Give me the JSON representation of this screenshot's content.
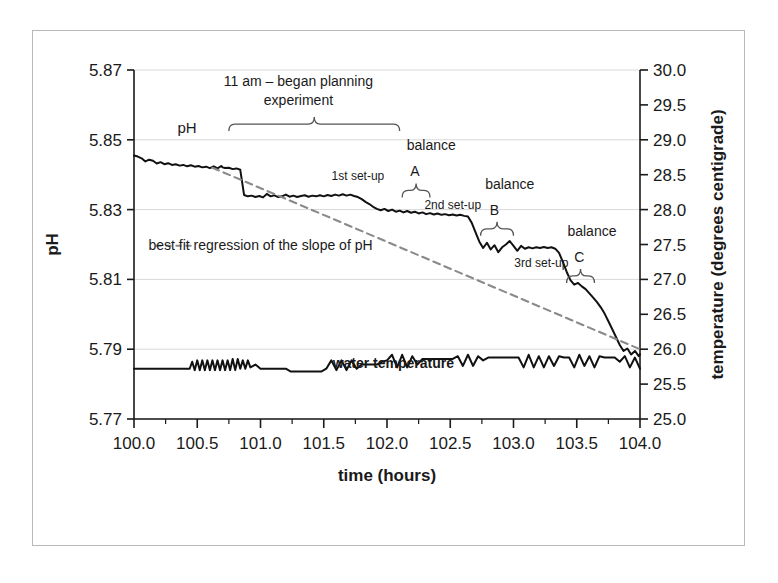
{
  "chart_data": {
    "type": "line",
    "title": "",
    "xlabel": "time (hours)",
    "ylabel": "pH",
    "y2label": "temperature (degrees centigrade)",
    "xlim": [
      100.0,
      104.0
    ],
    "ylim": [
      5.77,
      5.87
    ],
    "y2lim": [
      25.0,
      30.0
    ],
    "grid": true,
    "x_ticks": [
      "100.0",
      "100.5",
      "101.0",
      "101.5",
      "102.0",
      "102.5",
      "103.0",
      "103.5",
      "104.0"
    ],
    "x_tick_values": [
      100.0,
      100.5,
      101.0,
      101.5,
      102.0,
      102.5,
      103.0,
      103.5,
      104.0
    ],
    "x_minor_step": 0.25,
    "y_ticks": [
      "5.77",
      "5.79",
      "5.81",
      "5.83",
      "5.85",
      "5.87"
    ],
    "y_tick_values": [
      5.77,
      5.79,
      5.81,
      5.83,
      5.85,
      5.87
    ],
    "y2_ticks": [
      "25.0",
      "25.5",
      "26.0",
      "26.5",
      "27.0",
      "27.5",
      "28.0",
      "28.5",
      "29.0",
      "29.5",
      "30.0"
    ],
    "y2_tick_values": [
      25.0,
      25.5,
      26.0,
      26.5,
      27.0,
      27.5,
      28.0,
      28.5,
      29.0,
      29.5,
      30.0
    ],
    "legend_position": "inside-left",
    "series": [
      {
        "name": "pH",
        "axis": "left",
        "style": "solid-black",
        "color": "#111111",
        "x": [
          100.0,
          100.03,
          100.06,
          100.09,
          100.12,
          100.15,
          100.18,
          100.21,
          100.24,
          100.27,
          100.3,
          100.33,
          100.36,
          100.39,
          100.42,
          100.45,
          100.48,
          100.51,
          100.54,
          100.57,
          100.6,
          100.63,
          100.66,
          100.69,
          100.7,
          100.72,
          100.75,
          100.78,
          100.81,
          100.84,
          100.87,
          100.9,
          100.93,
          100.96,
          100.99,
          101.02,
          101.05,
          101.08,
          101.11,
          101.14,
          101.17,
          101.2,
          101.23,
          101.26,
          101.29,
          101.32,
          101.35,
          101.38,
          101.41,
          101.44,
          101.47,
          101.5,
          101.53,
          101.56,
          101.59,
          101.62,
          101.65,
          101.68,
          101.71,
          101.74,
          101.77,
          101.8,
          101.83,
          101.86,
          101.89,
          101.92,
          101.95,
          101.98,
          102.01,
          102.04,
          102.07,
          102.1,
          102.13,
          102.16,
          102.19,
          102.22,
          102.25,
          102.28,
          102.31,
          102.34,
          102.37,
          102.4,
          102.43,
          102.46,
          102.49,
          102.52,
          102.55,
          102.58,
          102.61,
          102.64,
          102.67,
          102.7,
          102.73,
          102.76,
          102.79,
          102.82,
          102.85,
          102.88,
          102.91,
          102.94,
          102.97,
          103.0,
          103.03,
          103.06,
          103.09,
          103.12,
          103.15,
          103.18,
          103.21,
          103.24,
          103.27,
          103.3,
          103.33,
          103.36,
          103.39,
          103.42,
          103.45,
          103.48,
          103.51,
          103.54,
          103.57,
          103.6,
          103.63,
          103.66,
          103.69,
          103.72,
          103.75,
          103.78,
          103.81,
          103.84,
          103.87,
          103.9,
          103.93,
          103.96,
          103.99,
          104.0
        ],
        "y": [
          5.8455,
          5.8452,
          5.8447,
          5.8438,
          5.8443,
          5.844,
          5.8432,
          5.8436,
          5.843,
          5.8433,
          5.8428,
          5.843,
          5.8426,
          5.8428,
          5.8424,
          5.8427,
          5.8423,
          5.8425,
          5.8421,
          5.8423,
          5.8419,
          5.8424,
          5.8418,
          5.8425,
          5.8421,
          5.8419,
          5.842,
          5.8416,
          5.8418,
          5.8414,
          5.8342,
          5.8338,
          5.834,
          5.8336,
          5.8339,
          5.8335,
          5.8345,
          5.8338,
          5.8341,
          5.8336,
          5.8338,
          5.8343,
          5.8337,
          5.834,
          5.8336,
          5.8339,
          5.8341,
          5.8337,
          5.834,
          5.8338,
          5.8341,
          5.8338,
          5.8342,
          5.8339,
          5.8343,
          5.834,
          5.8344,
          5.834,
          5.8343,
          5.8339,
          5.8336,
          5.833,
          5.8322,
          5.8316,
          5.8308,
          5.8302,
          5.8298,
          5.8302,
          5.8296,
          5.83,
          5.8294,
          5.8297,
          5.8292,
          5.8296,
          5.8291,
          5.8294,
          5.8289,
          5.8292,
          5.8287,
          5.829,
          5.8286,
          5.8289,
          5.8285,
          5.8287,
          5.8284,
          5.8286,
          5.8283,
          5.8285,
          5.8282,
          5.828,
          5.8262,
          5.8235,
          5.8208,
          5.819,
          5.8205,
          5.8186,
          5.8198,
          5.8178,
          5.8192,
          5.82,
          5.821,
          5.8196,
          5.8182,
          5.8196,
          5.8188,
          5.8192,
          5.8189,
          5.8192,
          5.819,
          5.8193,
          5.819,
          5.8192,
          5.8188,
          5.8176,
          5.815,
          5.8122,
          5.8098,
          5.8085,
          5.809,
          5.808,
          5.8072,
          5.806,
          5.8048,
          5.8035,
          5.802,
          5.8002,
          5.798,
          5.7958,
          5.7935,
          5.7912,
          5.7895,
          5.7902,
          5.7885,
          5.7895,
          5.788,
          5.7885
        ]
      },
      {
        "name": "best fit regression of the slope of pH",
        "axis": "left",
        "style": "dashed-gray",
        "color": "#8a8a8a",
        "x": [
          100.62,
          104.0
        ],
        "y": [
          5.842,
          5.79
        ]
      },
      {
        "name": "water temperature",
        "axis": "right",
        "style": "solid-black",
        "color": "#111111",
        "x": [
          100.0,
          100.04,
          100.08,
          100.12,
          100.16,
          100.2,
          100.24,
          100.28,
          100.32,
          100.36,
          100.4,
          100.44,
          100.46,
          100.48,
          100.5,
          100.52,
          100.54,
          100.56,
          100.58,
          100.6,
          100.62,
          100.64,
          100.66,
          100.68,
          100.7,
          100.72,
          100.74,
          100.76,
          100.78,
          100.8,
          100.82,
          100.84,
          100.86,
          100.88,
          100.9,
          100.92,
          100.96,
          101.0,
          101.04,
          101.08,
          101.12,
          101.16,
          101.2,
          101.24,
          101.28,
          101.32,
          101.36,
          101.4,
          101.44,
          101.48,
          101.52,
          101.56,
          101.6,
          101.64,
          101.68,
          101.72,
          101.76,
          101.8,
          101.84,
          101.88,
          101.92,
          101.96,
          102.0,
          102.04,
          102.08,
          102.12,
          102.16,
          102.2,
          102.24,
          102.28,
          102.32,
          102.36,
          102.4,
          102.44,
          102.48,
          102.52,
          102.56,
          102.6,
          102.64,
          102.68,
          102.72,
          102.76,
          102.8,
          102.84,
          102.88,
          102.92,
          102.96,
          103.0,
          103.04,
          103.08,
          103.12,
          103.16,
          103.2,
          103.24,
          103.28,
          103.32,
          103.36,
          103.4,
          103.44,
          103.48,
          103.52,
          103.56,
          103.6,
          103.64,
          103.68,
          103.72,
          103.76,
          103.8,
          103.84,
          103.88,
          103.92,
          103.96,
          104.0
        ],
        "y": [
          25.72,
          25.72,
          25.72,
          25.72,
          25.72,
          25.72,
          25.72,
          25.72,
          25.72,
          25.72,
          25.72,
          25.72,
          25.82,
          25.7,
          25.84,
          25.7,
          25.84,
          25.7,
          25.84,
          25.7,
          25.84,
          25.7,
          25.84,
          25.7,
          25.84,
          25.7,
          25.84,
          25.7,
          25.86,
          25.7,
          25.86,
          25.72,
          25.84,
          25.72,
          25.84,
          25.74,
          25.78,
          25.72,
          25.72,
          25.72,
          25.72,
          25.72,
          25.72,
          25.68,
          25.68,
          25.68,
          25.68,
          25.68,
          25.68,
          25.68,
          25.72,
          25.84,
          25.7,
          25.84,
          25.7,
          25.84,
          25.72,
          25.78,
          25.78,
          25.78,
          25.78,
          25.82,
          25.84,
          25.92,
          25.74,
          25.92,
          25.74,
          25.9,
          25.78,
          25.86,
          25.86,
          25.86,
          25.86,
          25.86,
          25.86,
          25.86,
          25.9,
          25.76,
          25.92,
          25.76,
          25.9,
          25.84,
          25.88,
          25.88,
          25.88,
          25.88,
          25.88,
          25.88,
          25.88,
          25.74,
          25.92,
          25.74,
          25.9,
          25.74,
          25.9,
          25.76,
          25.9,
          25.88,
          25.88,
          25.74,
          25.92,
          25.76,
          25.9,
          25.74,
          25.9,
          25.88,
          25.88,
          25.88,
          25.82,
          25.9,
          25.74,
          25.88,
          25.72
        ]
      }
    ],
    "annotations": [
      {
        "id": "ph-label",
        "text": "pH",
        "x": 100.42,
        "y": 5.852,
        "bold": false,
        "size": 15
      },
      {
        "id": "began-planning-line1",
        "text": "11 am – began planning",
        "x": 101.3,
        "y": 5.8655,
        "size": 14
      },
      {
        "id": "began-planning-line2",
        "text": "experiment",
        "x": 101.3,
        "y": 5.86,
        "size": 14
      },
      {
        "id": "first-setup",
        "text": "1st set-up",
        "x": 101.77,
        "y": 5.8385,
        "size": 12
      },
      {
        "id": "balance-a-word",
        "text": "balance",
        "x": 102.35,
        "y": 5.847,
        "size": 14
      },
      {
        "id": "balance-a-letter",
        "text": "A",
        "x": 102.22,
        "y": 5.8395,
        "size": 14
      },
      {
        "id": "second-setup",
        "text": "2nd set-up",
        "x": 102.52,
        "y": 5.8302,
        "size": 12
      },
      {
        "id": "balance-b-word",
        "text": "balance",
        "x": 102.97,
        "y": 5.836,
        "size": 14
      },
      {
        "id": "balance-b-letter",
        "text": "B",
        "x": 102.85,
        "y": 5.8285,
        "size": 14
      },
      {
        "id": "third-setup",
        "text": "3rd set-up",
        "x": 103.22,
        "y": 5.8135,
        "size": 12
      },
      {
        "id": "balance-c-word",
        "text": "balance",
        "x": 103.62,
        "y": 5.8225,
        "size": 14
      },
      {
        "id": "balance-c-letter",
        "text": "C",
        "x": 103.52,
        "y": 5.815,
        "size": 14
      },
      {
        "id": "legend-text",
        "text": "best fit regression of the slope of pH",
        "x": 101.0,
        "y": 5.8185,
        "size": 14
      },
      {
        "id": "water-temperature-label",
        "text": "water temperature",
        "x": 102.05,
        "y": 5.7845,
        "bold": true,
        "size": 14
      }
    ],
    "braces": [
      {
        "id": "brace-planning",
        "x0": 100.75,
        "x1": 102.1,
        "y": 5.8545
      },
      {
        "id": "brace-balance-a",
        "x0": 102.12,
        "x1": 102.34,
        "y": 5.8355
      },
      {
        "id": "brace-balance-b",
        "x0": 102.74,
        "x1": 103.0,
        "y": 5.8245
      },
      {
        "id": "brace-balance-c",
        "x0": 103.42,
        "x1": 103.64,
        "y": 5.811
      }
    ]
  },
  "axes": {
    "x_title": "time (hours)",
    "y_title": "pH",
    "y2_title": "temperature (degrees centigrade)"
  },
  "legend": {
    "entry_label": "best fit regression of the slope of pH",
    "dash_swatch": "dashed-line"
  }
}
